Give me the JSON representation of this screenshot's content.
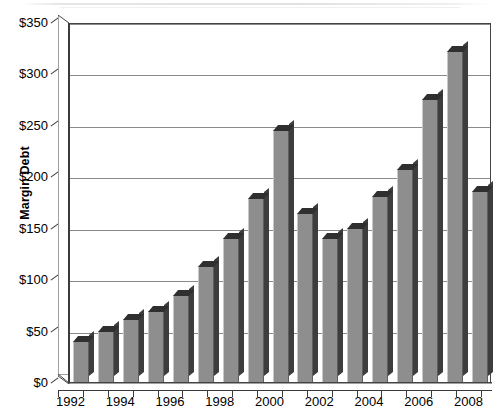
{
  "chart_data": {
    "type": "bar",
    "title": "",
    "xlabel": "",
    "ylabel": "Margin Debt",
    "ylim": [
      0,
      350
    ],
    "ytick_values": [
      0,
      50,
      100,
      150,
      200,
      250,
      300,
      350
    ],
    "ytick_labels": [
      "$0",
      "$50",
      "$100",
      "$150",
      "$200",
      "$250",
      "$300",
      "$350"
    ],
    "grid": true,
    "legend": "none",
    "style": "3d-bar-grayscale",
    "categories": [
      "1992",
      "1993",
      "1994",
      "1995",
      "1996",
      "1997",
      "1998",
      "1999",
      "2000",
      "2001",
      "2002",
      "2003",
      "2004",
      "2005",
      "2006",
      "2007",
      "2008"
    ],
    "xtick_labels": [
      "1992",
      "1994",
      "1996",
      "1998",
      "2000",
      "2002",
      "2004",
      "2006",
      "2008"
    ],
    "values": [
      40,
      50,
      61,
      69,
      85,
      113,
      140,
      179,
      245,
      164,
      140,
      150,
      181,
      207,
      275,
      322,
      186
    ],
    "series": [
      {
        "name": "Margin Debt",
        "values": [
          40,
          50,
          61,
          69,
          85,
          113,
          140,
          179,
          245,
          164,
          140,
          150,
          181,
          207,
          275,
          322,
          186
        ]
      }
    ],
    "colors": {
      "bar_face": "#8e8e8e",
      "bar_shadow": "#3d3d3d",
      "gridline": "#8a8a8a",
      "axis": "#3a3a3a",
      "background": "#ffffff",
      "text": "#000000"
    }
  }
}
